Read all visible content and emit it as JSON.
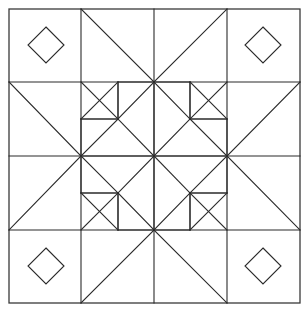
{
  "figure": {
    "title": "Geometric quilt block line drawing",
    "style": {
      "background_color": "#ffffff",
      "line_color": "#2b2b2b",
      "frame_color": "#3a3a3a",
      "line_width": 1.1,
      "fill": "none"
    },
    "canvas": {
      "width": 307,
      "height": 312
    },
    "geometry": {
      "frame": {
        "left": 9,
        "top": 9,
        "right": 300,
        "bottom": 303
      },
      "grid_x": [
        9,
        81,
        154,
        227,
        300
      ],
      "grid_y": [
        9,
        82,
        156,
        230,
        303
      ],
      "center": {
        "x": 154,
        "y": 156
      },
      "corner_diamonds": [
        {
          "name": "diamond-top-left",
          "cx": 46,
          "cy": 45,
          "r": 18
        },
        {
          "name": "diamond-top-right",
          "cx": 263,
          "cy": 45,
          "r": 18
        },
        {
          "name": "diamond-bottom-left",
          "cx": 46,
          "cy": 266,
          "r": 18
        },
        {
          "name": "diamond-bottom-right",
          "cx": 263,
          "cy": 266,
          "r": 18
        }
      ]
    },
    "shape_list": [
      {
        "name": "outer-frame",
        "kind": "square"
      },
      {
        "name": "grid-lines",
        "kind": "lines",
        "count": 4
      },
      {
        "name": "corner-diamonds",
        "kind": "diamond",
        "count": 4
      },
      {
        "name": "center-pinwheel-star",
        "kind": "star",
        "points": 8
      },
      {
        "name": "edge-kite-points",
        "kind": "kite",
        "count": 4
      },
      {
        "name": "inner-octagon-ring",
        "kind": "polygon",
        "count": 1
      },
      {
        "name": "corner-square-blocks",
        "kind": "square",
        "count": 4
      }
    ]
  }
}
